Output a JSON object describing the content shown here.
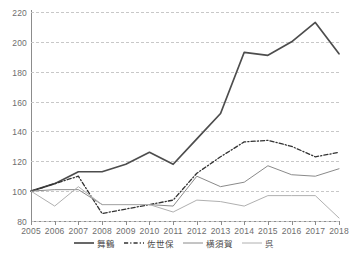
{
  "chart_data": {
    "type": "line",
    "title": "",
    "subtitle": "",
    "xlabel": "",
    "ylabel": "",
    "grid": true,
    "legend_position": "bottom",
    "xlim": [
      2005,
      2018
    ],
    "ylim": [
      80,
      220
    ],
    "ytick_step": 20,
    "yticks": [
      80,
      100,
      120,
      140,
      160,
      180,
      200,
      220
    ],
    "categories": [
      2005,
      2006,
      2007,
      2008,
      2009,
      2010,
      2011,
      2012,
      2013,
      2014,
      2015,
      2016,
      2017,
      2018
    ],
    "xticks": [
      "2005",
      "2006",
      "2007",
      "2008",
      "2009",
      "2010",
      "2011",
      "2012",
      "2013",
      "2014",
      "2015",
      "2016",
      "2017",
      "2018"
    ],
    "series": [
      {
        "name": "舞鶴",
        "style": "solid",
        "color": "#4d4d4d",
        "width": 1.7,
        "values": [
          100,
          105,
          113,
          113,
          118,
          126,
          118,
          135,
          152,
          193,
          191,
          200,
          213,
          192
        ]
      },
      {
        "name": "佐世保",
        "style": "dashdot",
        "color": "#333333",
        "width": 1.3,
        "values": [
          100,
          105,
          110,
          85,
          88,
          91,
          94,
          112,
          123,
          133,
          134,
          130,
          123,
          126
        ]
      },
      {
        "name": "横須賀",
        "style": "solid",
        "color": "#8a8a8a",
        "width": 1.0,
        "values": [
          100,
          101,
          101,
          91,
          91,
          91,
          90,
          110,
          103,
          106,
          117,
          111,
          110,
          115
        ]
      },
      {
        "name": "呉",
        "style": "solid",
        "color": "#b0b0b0",
        "width": 1.0,
        "values": [
          100,
          90,
          103,
          91,
          91,
          91,
          86,
          94,
          93,
          90,
          97,
          97,
          97,
          82
        ]
      }
    ]
  },
  "legend": {
    "items": [
      {
        "label": "舞鶴",
        "swatch": "line-solid-dark"
      },
      {
        "label": "佐世保",
        "swatch": "line-dashdot-dark"
      },
      {
        "label": "横須賀",
        "swatch": "line-solid-gray"
      },
      {
        "label": "呉",
        "swatch": "line-solid-light"
      }
    ]
  }
}
